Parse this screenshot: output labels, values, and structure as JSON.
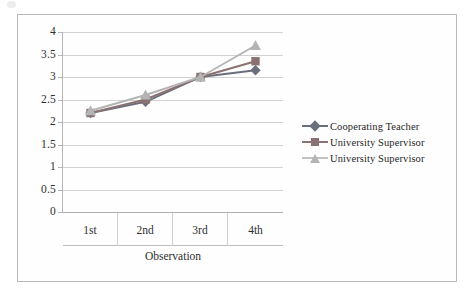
{
  "chart_data": {
    "type": "line",
    "title": "",
    "xlabel": "Observation",
    "ylabel": "",
    "categories": [
      "1st",
      "2nd",
      "3rd",
      "4th"
    ],
    "ylim": [
      0,
      4
    ],
    "ytick_labels": [
      "4",
      "3.5",
      "3",
      "2.5",
      "2",
      "1.5",
      "1",
      "0.5",
      "0"
    ],
    "ytick_values": [
      4,
      3.5,
      3,
      2.5,
      2,
      1.5,
      1,
      0.5,
      0
    ],
    "grid": true,
    "legend_position": "right",
    "series": [
      {
        "name": "Cooperating Teacher",
        "marker": "diamond",
        "color": "#6a6f7d",
        "values": [
          2.2,
          2.45,
          3.0,
          3.15
        ]
      },
      {
        "name": "University Supervisor",
        "marker": "square",
        "color": "#8a7272",
        "values": [
          2.2,
          2.5,
          3.0,
          3.35
        ]
      },
      {
        "name": "University Supervisor",
        "marker": "triangle",
        "color": "#b4b4b4",
        "values": [
          2.25,
          2.6,
          3.0,
          3.7
        ]
      }
    ]
  },
  "legend": {
    "items": [
      {
        "label": "Cooperating Teacher"
      },
      {
        "label": "University Supervisor"
      },
      {
        "label": "University Supervisor"
      }
    ]
  },
  "axis": {
    "x_title": "Observation"
  }
}
